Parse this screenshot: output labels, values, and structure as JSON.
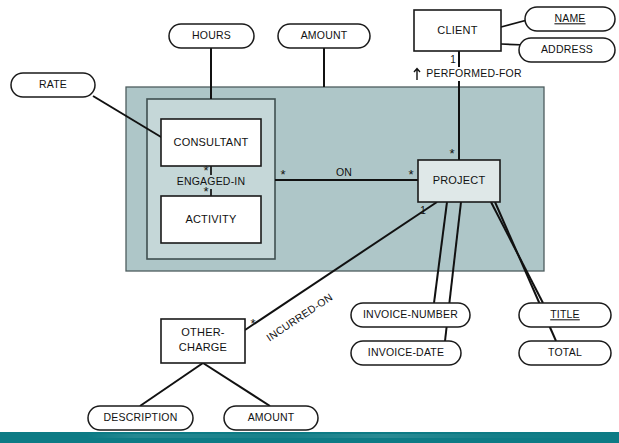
{
  "diagram": {
    "type": "entity-relationship-diagram",
    "entities": [
      {
        "id": "client",
        "label": "CLIENT"
      },
      {
        "id": "project",
        "label": "PROJECT"
      },
      {
        "id": "consultant",
        "label": "CONSULTANT"
      },
      {
        "id": "activity",
        "label": "ACTIVITY"
      },
      {
        "id": "other_charge",
        "label_line1": "OTHER-",
        "label_line2": "CHARGE"
      }
    ],
    "attributes": [
      {
        "id": "hours",
        "label": "HOURS",
        "key": false
      },
      {
        "id": "amount_top",
        "label": "AMOUNT",
        "key": false
      },
      {
        "id": "rate",
        "label": "RATE",
        "key": false
      },
      {
        "id": "name",
        "label": "NAME",
        "key": true
      },
      {
        "id": "address",
        "label": "ADDRESS",
        "key": false
      },
      {
        "id": "invoice_number",
        "label": "INVOICE-NUMBER",
        "key": false
      },
      {
        "id": "invoice_date",
        "label": "INVOICE-DATE",
        "key": false
      },
      {
        "id": "title",
        "label": "TITLE",
        "key": true
      },
      {
        "id": "total",
        "label": "TOTAL",
        "key": false
      },
      {
        "id": "description",
        "label": "DESCRIPTION",
        "key": false
      },
      {
        "id": "amount_bottom",
        "label": "AMOUNT",
        "key": false
      }
    ],
    "relationships": [
      {
        "id": "performed_for",
        "label": "PERFORMED-FOR",
        "from": "client",
        "to": "project",
        "from_cardinality": "1",
        "to_cardinality": "*"
      },
      {
        "id": "on",
        "label": "ON",
        "from": "composite",
        "to": "project",
        "from_cardinality": "*",
        "to_cardinality": "*"
      },
      {
        "id": "engaged_in",
        "label": "ENGAGED-IN",
        "from": "consultant",
        "to": "activity",
        "from_cardinality": "*",
        "to_cardinality": "*"
      },
      {
        "id": "incurred_on",
        "label": "INCURRED-ON",
        "from": "other_charge",
        "to": "project",
        "from_cardinality": "*",
        "to_cardinality": "1"
      }
    ],
    "cardinality_marks": {
      "client_to_rel": "1",
      "rel_to_project": "*",
      "composite_side": "*",
      "project_side": "*",
      "consultant_side": "*",
      "activity_side": "*",
      "other_charge_side": "*",
      "project_incurred_side": "1"
    },
    "colors": {
      "outer_band": "#aec6c8",
      "inner_panel": "#c5d7d8",
      "entity_shaded": "#dfe8e8",
      "entity_plain": "#ffffff",
      "stroke": "#111111",
      "footer_bar": "#0d7b85",
      "page_background": "#ffffff"
    }
  }
}
